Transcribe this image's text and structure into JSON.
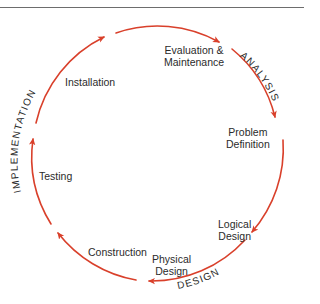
{
  "diagram": {
    "type": "system-development-life-cycle",
    "arrow_color": "#d9402b",
    "text_color": "#2b2b2b",
    "stages": [
      {
        "id": "evaluation",
        "line1": "Evaluation &",
        "line2": "Maintenance"
      },
      {
        "id": "problem-definition",
        "line1": "Problem",
        "line2": "Definition"
      },
      {
        "id": "logical-design",
        "line1": "Logical",
        "line2": "Design"
      },
      {
        "id": "physical-design",
        "line1": "Physical",
        "line2": "Design"
      },
      {
        "id": "construction",
        "line1": "Construction",
        "line2": ""
      },
      {
        "id": "testing",
        "line1": "Testing",
        "line2": ""
      },
      {
        "id": "installation",
        "line1": "Installation",
        "line2": ""
      }
    ],
    "phases": [
      {
        "id": "analysis",
        "label": "ANALYSIS"
      },
      {
        "id": "design",
        "label": "DESIGN"
      },
      {
        "id": "implementation",
        "label": "IMPLEMENTATION"
      }
    ]
  }
}
